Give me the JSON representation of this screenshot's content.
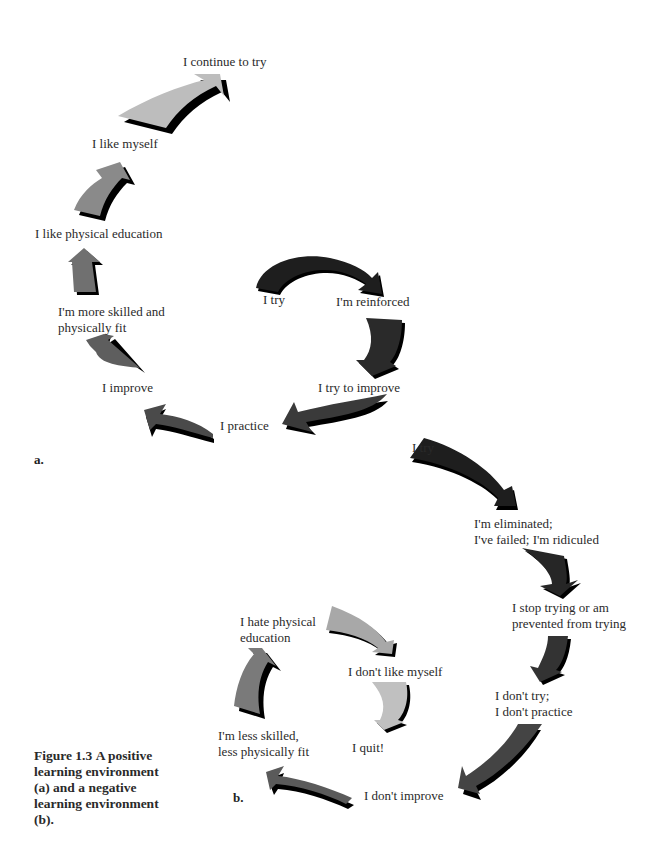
{
  "figure": {
    "caption_label": "Figure 1.3",
    "caption_text": "A positive learning environment (a) and a negative learning environment (b)."
  },
  "panel_a": {
    "letter": "a.",
    "steps": [
      {
        "label": "I try",
        "arrow_color": "#1e1e1e"
      },
      {
        "label": "I'm reinforced",
        "arrow_color": "#2a2a2a"
      },
      {
        "label": "I try to improve",
        "arrow_color": "#3a3a3a"
      },
      {
        "label": "I practice",
        "arrow_color": "#4a4a4a"
      },
      {
        "label": "I improve",
        "arrow_color": "#5e5e5e"
      },
      {
        "label": "I'm more skilled and",
        "label2": "physically fit",
        "arrow_color": "#707070"
      },
      {
        "label": "I like physical education",
        "arrow_color": "#8a8a8a"
      },
      {
        "label": "I like myself",
        "arrow_color": "#a0a0a0"
      },
      {
        "label": "I continue to try",
        "arrow_color": "#bdbdbd"
      }
    ]
  },
  "panel_b": {
    "letter": "b.",
    "steps": [
      {
        "label": "I try",
        "arrow_color": "#1e1e1e"
      },
      {
        "label": "I'm eliminated;",
        "label2": "I've failed; I'm ridiculed",
        "arrow_color": "#262626"
      },
      {
        "label": "I stop trying or am",
        "label2": "prevented from trying",
        "arrow_color": "#333333"
      },
      {
        "label": "I don't try;",
        "label2": "I don't practice",
        "arrow_color": "#444444"
      },
      {
        "label": "I don't improve",
        "arrow_color": "#5a5a5a"
      },
      {
        "label": "I'm less skilled,",
        "label2": "less physically fit",
        "arrow_color": "#7a7a7a"
      },
      {
        "label": "I hate physical",
        "label2": "education",
        "arrow_color": "#a8a8a8"
      },
      {
        "label": "I don't like myself",
        "arrow_color": "#c0c0c0"
      },
      {
        "label": "I quit!"
      }
    ]
  }
}
